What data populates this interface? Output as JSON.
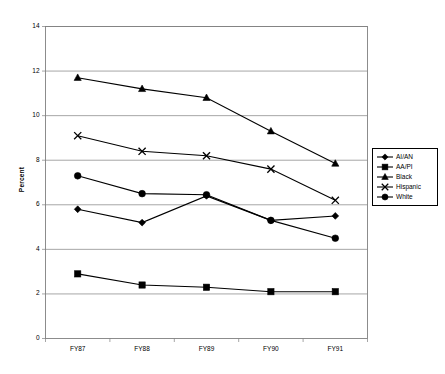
{
  "chart_data": {
    "type": "line",
    "title": "",
    "xlabel": "",
    "ylabel": "Percent",
    "categories": [
      "FY87",
      "FY88",
      "FY89",
      "FY90",
      "FY91"
    ],
    "ylim": [
      0,
      14
    ],
    "ytick_step": 2,
    "yticks": [
      "0",
      "2",
      "4",
      "6",
      "8",
      "10",
      "12",
      "14"
    ],
    "grid": "horizontal",
    "legend_position": "right",
    "series": [
      {
        "name": "AI/AN",
        "marker": "diamond",
        "values": [
          5.8,
          5.2,
          6.4,
          5.3,
          5.5
        ]
      },
      {
        "name": "AA/PI",
        "marker": "square",
        "values": [
          2.9,
          2.4,
          2.3,
          2.1,
          2.1
        ]
      },
      {
        "name": "Black",
        "marker": "triangle",
        "values": [
          11.7,
          11.2,
          10.8,
          9.3,
          7.85
        ]
      },
      {
        "name": "Hispanic",
        "marker": "x",
        "values": [
          9.1,
          8.4,
          8.2,
          7.6,
          6.2
        ]
      },
      {
        "name": "White",
        "marker": "circle",
        "values": [
          7.3,
          6.5,
          6.45,
          5.3,
          4.5
        ]
      }
    ]
  },
  "colors": {
    "line": "#000000",
    "grid": "#808080",
    "axis": "#808080",
    "background": "#ffffff"
  },
  "legend": {
    "items": [
      "AI/AN",
      "AA/PI",
      "Black",
      "Hispanic",
      "White"
    ]
  }
}
